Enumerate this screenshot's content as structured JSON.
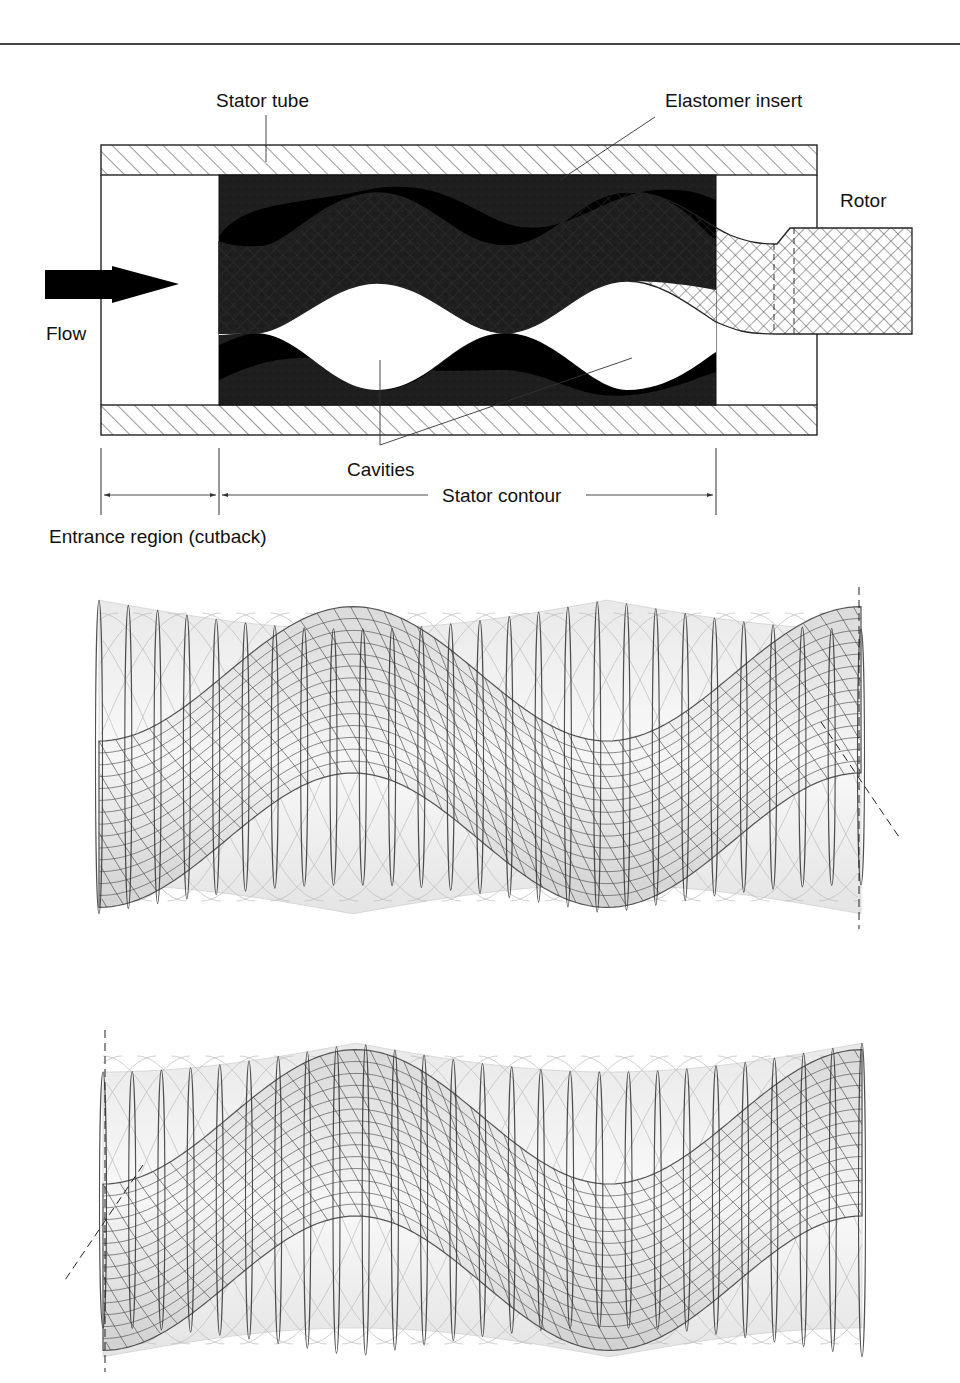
{
  "figure": {
    "cross_section": {
      "labels": {
        "stator_tube": "Stator tube",
        "elastomer_insert": "Elastomer insert",
        "rotor": "Rotor",
        "flow": "Flow",
        "cavities": "Cavities",
        "stator_contour": "Stator contour",
        "entrance_region": "Entrance region (cutback)"
      },
      "colors": {
        "elastomer": "#1c1c1c",
        "elastomer_dark": "#000000",
        "line": "#222222",
        "hatch": "#333333"
      }
    },
    "wireframe_views": [
      {
        "id": "rotor-in-stator-view-1",
        "axis_marker": "right"
      },
      {
        "id": "rotor-in-stator-view-2",
        "axis_marker": "left"
      }
    ]
  }
}
